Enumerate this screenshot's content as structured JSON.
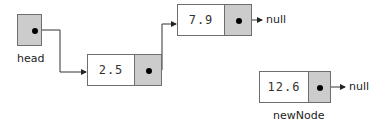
{
  "diagram": {
    "title": "",
    "type": "linked-list",
    "head": {
      "label": "head"
    },
    "nodes": [
      {
        "id": "n1",
        "value": "2.5",
        "next": "n2"
      },
      {
        "id": "n2",
        "value": "7.9",
        "next": "null",
        "next_label": "null"
      },
      {
        "id": "n3",
        "value": "12.6",
        "next": "null",
        "next_label": "null",
        "label": "newNode"
      }
    ],
    "colors": {
      "pointer_fill": "#cccccc",
      "data_fill": "#ffffff",
      "border": "#6e6e6e"
    }
  }
}
